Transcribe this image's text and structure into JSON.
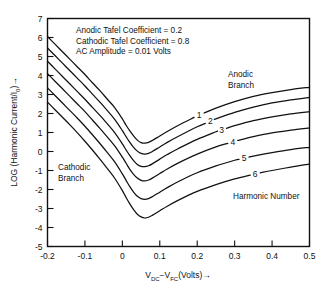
{
  "chart_data": {
    "type": "line",
    "title": "",
    "xlabel": "V_DC - V_FC (Volts)",
    "ylabel": "LOG (Harmonic Current/I_0)",
    "xlim": [
      -0.2,
      0.5
    ],
    "ylim": [
      -5,
      7
    ],
    "grid": false,
    "legend_position": "inline-labels",
    "xticks": [
      -0.2,
      -0.1,
      0,
      0.1,
      0.2,
      0.3,
      0.4,
      0.5
    ],
    "xtick_labels": [
      "-0.2",
      "-0.1",
      "0",
      "0.1",
      "0.2",
      "0.3",
      "0.4",
      "0.5"
    ],
    "yticks": [
      -5,
      -4,
      -3,
      -2,
      -1,
      0,
      1,
      2,
      3,
      4,
      5,
      6,
      7
    ],
    "ytick_labels": [
      "-5",
      "-4",
      "-3",
      "-2",
      "-1",
      "0",
      "1",
      "2",
      "3",
      "4",
      "5",
      "6",
      "7"
    ],
    "series": [
      {
        "name": "1",
        "harmonic": 1,
        "label": "1",
        "x": [
          -0.2,
          -0.18,
          -0.16,
          -0.14,
          -0.12,
          -0.1,
          -0.08,
          -0.06,
          -0.04,
          -0.02,
          0.0,
          0.01,
          0.02,
          0.03,
          0.04,
          0.05,
          0.06,
          0.07,
          0.08,
          0.1,
          0.12,
          0.15,
          0.2,
          0.25,
          0.3,
          0.35,
          0.4,
          0.45,
          0.5
        ],
        "y": [
          6.05,
          5.65,
          5.25,
          4.85,
          4.45,
          4.05,
          3.62,
          3.2,
          2.75,
          2.3,
          1.72,
          1.38,
          1.08,
          0.82,
          0.6,
          0.47,
          0.44,
          0.48,
          0.58,
          0.82,
          1.05,
          1.38,
          1.88,
          2.28,
          2.62,
          2.9,
          3.1,
          3.26,
          3.38
        ]
      },
      {
        "name": "2",
        "harmonic": 2,
        "label": "2",
        "x": [
          -0.2,
          -0.18,
          -0.16,
          -0.14,
          -0.12,
          -0.1,
          -0.08,
          -0.06,
          -0.04,
          -0.02,
          0.0,
          0.01,
          0.02,
          0.03,
          0.04,
          0.05,
          0.06,
          0.07,
          0.08,
          0.1,
          0.12,
          0.15,
          0.2,
          0.25,
          0.3,
          0.35,
          0.4,
          0.45,
          0.5
        ],
        "y": [
          5.45,
          5.05,
          4.65,
          4.25,
          3.85,
          3.45,
          3.02,
          2.6,
          2.15,
          1.68,
          1.1,
          0.78,
          0.48,
          0.22,
          0.02,
          -0.1,
          -0.14,
          -0.1,
          0.0,
          0.24,
          0.48,
          0.8,
          1.3,
          1.72,
          2.06,
          2.34,
          2.56,
          2.72,
          2.85
        ]
      },
      {
        "name": "3",
        "harmonic": 3,
        "label": "3",
        "x": [
          -0.2,
          -0.18,
          -0.16,
          -0.14,
          -0.12,
          -0.1,
          -0.08,
          -0.06,
          -0.04,
          -0.02,
          0.0,
          0.01,
          0.02,
          0.03,
          0.04,
          0.05,
          0.06,
          0.07,
          0.08,
          0.1,
          0.12,
          0.15,
          0.2,
          0.25,
          0.3,
          0.35,
          0.4,
          0.45,
          0.5
        ],
        "y": [
          4.75,
          4.35,
          3.95,
          3.55,
          3.15,
          2.75,
          2.32,
          1.9,
          1.45,
          0.98,
          0.4,
          0.08,
          -0.22,
          -0.48,
          -0.68,
          -0.78,
          -0.8,
          -0.75,
          -0.65,
          -0.4,
          -0.16,
          0.16,
          0.64,
          1.04,
          1.36,
          1.62,
          1.82,
          1.98,
          2.1
        ]
      },
      {
        "name": "4",
        "harmonic": 4,
        "label": "4",
        "x": [
          -0.2,
          -0.18,
          -0.16,
          -0.14,
          -0.12,
          -0.1,
          -0.08,
          -0.06,
          -0.04,
          -0.02,
          0.0,
          0.01,
          0.02,
          0.03,
          0.04,
          0.05,
          0.06,
          0.07,
          0.08,
          0.1,
          0.12,
          0.15,
          0.2,
          0.25,
          0.3,
          0.35,
          0.4,
          0.45,
          0.5
        ],
        "y": [
          4.1,
          3.7,
          3.3,
          2.9,
          2.5,
          2.1,
          1.66,
          1.22,
          0.76,
          0.28,
          -0.3,
          -0.62,
          -0.94,
          -1.2,
          -1.4,
          -1.52,
          -1.55,
          -1.5,
          -1.4,
          -1.16,
          -0.92,
          -0.6,
          -0.14,
          0.24,
          0.54,
          0.78,
          0.98,
          1.12,
          1.24
        ]
      },
      {
        "name": "5",
        "harmonic": 5,
        "label": "5",
        "x": [
          -0.2,
          -0.18,
          -0.16,
          -0.14,
          -0.12,
          -0.1,
          -0.08,
          -0.06,
          -0.04,
          -0.02,
          0.0,
          0.01,
          0.02,
          0.03,
          0.04,
          0.05,
          0.06,
          0.07,
          0.08,
          0.1,
          0.12,
          0.15,
          0.2,
          0.25,
          0.3,
          0.35,
          0.4,
          0.45,
          0.5
        ],
        "y": [
          3.35,
          2.95,
          2.55,
          2.15,
          1.75,
          1.33,
          0.88,
          0.42,
          -0.06,
          -0.56,
          -1.18,
          -1.52,
          -1.85,
          -2.14,
          -2.36,
          -2.48,
          -2.52,
          -2.48,
          -2.38,
          -2.14,
          -1.9,
          -1.58,
          -1.12,
          -0.76,
          -0.46,
          -0.24,
          -0.06,
          0.1,
          0.22
        ]
      },
      {
        "name": "6",
        "harmonic": 6,
        "label": "6",
        "x": [
          -0.2,
          -0.18,
          -0.16,
          -0.14,
          -0.12,
          -0.1,
          -0.08,
          -0.06,
          -0.04,
          -0.02,
          0.0,
          0.01,
          0.02,
          0.03,
          0.04,
          0.05,
          0.06,
          0.07,
          0.08,
          0.1,
          0.12,
          0.15,
          0.2,
          0.25,
          0.3,
          0.35,
          0.4,
          0.45,
          0.5
        ],
        "y": [
          2.6,
          2.2,
          1.8,
          1.4,
          0.98,
          0.54,
          0.08,
          -0.4,
          -0.9,
          -1.42,
          -2.06,
          -2.42,
          -2.76,
          -3.06,
          -3.3,
          -3.44,
          -3.5,
          -3.46,
          -3.36,
          -3.12,
          -2.88,
          -2.56,
          -2.1,
          -1.74,
          -1.44,
          -1.2,
          -1.0,
          -0.82,
          -0.66
        ]
      }
    ],
    "annotations": {
      "anodic_tafel": "Anodic Tafel Coefficient = 0.2",
      "cathodic_tafel": "Cathodic Tafel Coefficient = 0.8",
      "ac_amplitude": "AC Amplitude = 0.01 Volts",
      "anodic_branch_line1": "Anodic",
      "anodic_branch_line2": "Branch",
      "cathodic_branch_line1": "Cathodic",
      "cathodic_branch_line2": "Branch",
      "harmonic_number": "Harmonic Number"
    },
    "axis_title_parts": {
      "x_v1": "V",
      "x_v1_sub": "DC",
      "x_minus": "−",
      "x_v2": "V",
      "x_v2_sub": "FC",
      "x_units": "(Volts)",
      "x_arrow": "→",
      "y_main": "LOG (Harmonic Current/I",
      "y_sub": "0",
      "y_close": ")",
      "y_arrow": "→"
    },
    "colors": {
      "curve": "#111111",
      "axis": "#111111",
      "background": "#ffffff"
    }
  }
}
